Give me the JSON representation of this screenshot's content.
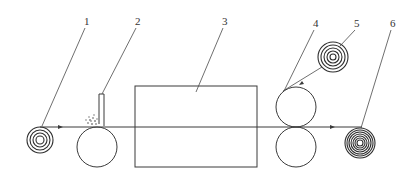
{
  "diagram": {
    "type": "process-schematic",
    "web_direction": "left-to-right",
    "labels": [
      {
        "id": "1",
        "text": "1",
        "x": 87,
        "y": 25,
        "target": "unwind-roll"
      },
      {
        "id": "2",
        "text": "2",
        "x": 138,
        "y": 25,
        "target": "coating-blade"
      },
      {
        "id": "3",
        "text": "3",
        "x": 225,
        "y": 25,
        "target": "drying-oven"
      },
      {
        "id": "4",
        "text": "4",
        "x": 316,
        "y": 27,
        "target": "nip-rollers"
      },
      {
        "id": "5",
        "text": "5",
        "x": 357,
        "y": 27,
        "target": "laminate-film-roll"
      },
      {
        "id": "6",
        "text": "6",
        "x": 393,
        "y": 27,
        "target": "rewind-roll"
      }
    ],
    "components": {
      "unwind_roll": {
        "cx": 40,
        "cy": 140,
        "rings": [
          13,
          10,
          7,
          4
        ]
      },
      "coating_roller": {
        "cx": 97,
        "cy": 147,
        "r": 20
      },
      "blade": {
        "x": 99,
        "y_top": 93,
        "y_bottom": 124,
        "width": 5
      },
      "coating_material": {
        "cx": 92,
        "cy": 121,
        "r": 6
      },
      "oven_box": {
        "x": 135,
        "y": 86,
        "w": 122,
        "h": 81
      },
      "nip_upper": {
        "cx": 296,
        "cy": 107,
        "r": 20
      },
      "nip_lower": {
        "cx": 296,
        "cy": 147,
        "r": 20
      },
      "laminate_roll": {
        "cx": 333,
        "cy": 57,
        "rings": [
          15,
          12,
          9,
          6,
          3
        ]
      },
      "rewind_roll": {
        "cx": 360,
        "cy": 143,
        "rings": [
          15,
          13,
          11,
          9,
          7,
          5,
          3
        ]
      },
      "web_line": {
        "x1": 40,
        "x2": 362,
        "y": 127
      }
    },
    "colors": {
      "line": "#3a3a3a",
      "background": "#ffffff"
    }
  }
}
